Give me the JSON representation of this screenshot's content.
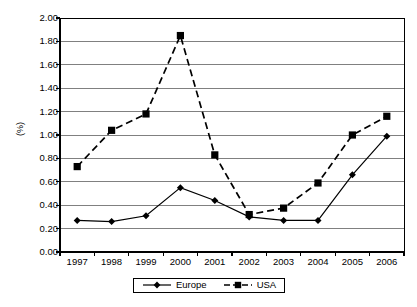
{
  "chart_data": {
    "type": "line",
    "title": "",
    "subtitle": "",
    "xlabel": "",
    "ylabel": "(%)",
    "categories": [
      "1997",
      "1998",
      "1999",
      "2000",
      "2001",
      "2002",
      "2003",
      "2004",
      "2005",
      "2006"
    ],
    "series": [
      {
        "name": "Europe",
        "marker": "diamond",
        "line_style": "solid",
        "color": "#000000",
        "values": [
          0.27,
          0.26,
          0.31,
          0.55,
          0.44,
          0.3,
          0.27,
          0.27,
          0.66,
          0.99
        ]
      },
      {
        "name": "USA",
        "marker": "square",
        "line_style": "dashed",
        "color": "#000000",
        "values": [
          0.73,
          1.04,
          1.18,
          1.85,
          0.83,
          0.32,
          0.375,
          0.59,
          1.0,
          1.16
        ]
      }
    ],
    "ylim": [
      0.0,
      2.0
    ],
    "ytick_values": [
      0.0,
      0.2,
      0.4,
      0.6,
      0.8,
      1.0,
      1.2,
      1.4,
      1.6,
      1.8,
      2.0
    ],
    "ytick_labels": [
      "0.00",
      "0.20",
      "0.40",
      "0.60",
      "0.80",
      "1.00",
      "1.20",
      "1.40",
      "1.60",
      "1.80",
      "2.00"
    ],
    "grid": "horizontal",
    "grid_color": "#808080",
    "legend_position": "bottom",
    "legend_entries": [
      "Europe",
      "USA"
    ],
    "axis_color": "#000000",
    "plot_background": "#ffffff"
  },
  "legend": {
    "items": [
      {
        "label": "Europe",
        "icon": "diamond-marker-solid-line-icon"
      },
      {
        "label": "USA",
        "icon": "square-marker-dashed-line-icon"
      }
    ]
  },
  "axes": {
    "y_title": "(%)"
  }
}
